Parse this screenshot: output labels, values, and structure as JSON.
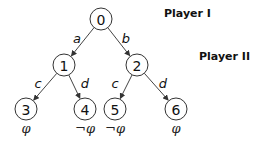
{
  "players": [
    {
      "label": "Player I",
      "x": 164,
      "y": 14
    },
    {
      "label": "Player II",
      "x": 199,
      "y": 57
    }
  ],
  "nodes": [
    {
      "id": "0",
      "label": "0",
      "x": 101,
      "y": 19
    },
    {
      "id": "1",
      "label": "1",
      "x": 64,
      "y": 65
    },
    {
      "id": "2",
      "label": "2",
      "x": 137,
      "y": 65
    },
    {
      "id": "3",
      "label": "3",
      "x": 26,
      "y": 109,
      "leaf": "φ"
    },
    {
      "id": "4",
      "label": "4",
      "x": 85,
      "y": 109,
      "leaf": "¬φ"
    },
    {
      "id": "5",
      "label": "5",
      "x": 115,
      "y": 109,
      "leaf": "¬φ"
    },
    {
      "id": "6",
      "label": "6",
      "x": 176,
      "y": 109,
      "leaf": "φ"
    }
  ],
  "edges": [
    {
      "from": "0",
      "to": "1",
      "label": "a",
      "lx": 77,
      "ly": 38
    },
    {
      "from": "0",
      "to": "2",
      "label": "b",
      "lx": 126,
      "ly": 38
    },
    {
      "from": "1",
      "to": "3",
      "label": "c",
      "lx": 38,
      "ly": 83
    },
    {
      "from": "1",
      "to": "4",
      "label": "d",
      "lx": 85,
      "ly": 83
    },
    {
      "from": "2",
      "to": "5",
      "label": "c",
      "lx": 115,
      "ly": 83
    },
    {
      "from": "2",
      "to": "6",
      "label": "d",
      "lx": 163,
      "ly": 83
    }
  ],
  "node_radius": 11
}
